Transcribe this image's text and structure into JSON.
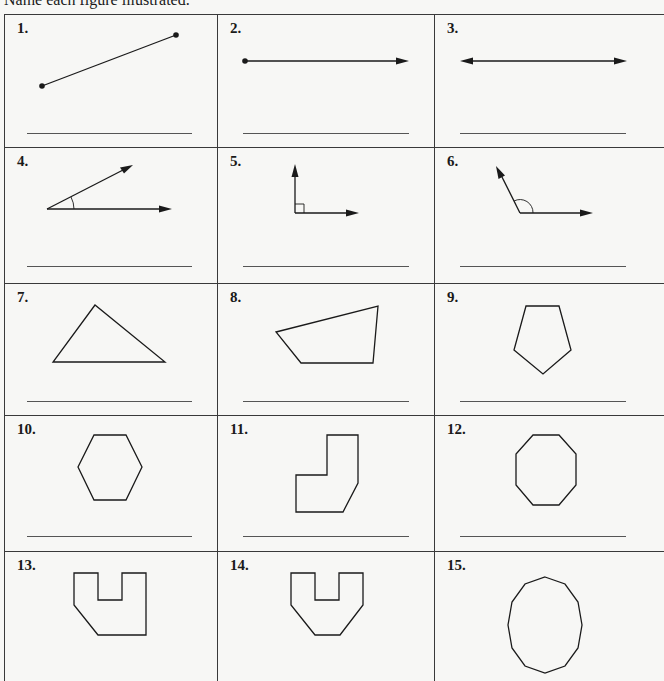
{
  "worksheet": {
    "instructions": "Name each figure illustrated.",
    "items": [
      {
        "number": "1.",
        "figure": "line-segment",
        "answer": ""
      },
      {
        "number": "2.",
        "figure": "ray",
        "answer": ""
      },
      {
        "number": "3.",
        "figure": "line",
        "answer": ""
      },
      {
        "number": "4.",
        "figure": "acute-angle",
        "answer": ""
      },
      {
        "number": "5.",
        "figure": "right-angle",
        "answer": ""
      },
      {
        "number": "6.",
        "figure": "obtuse-angle",
        "answer": ""
      },
      {
        "number": "7.",
        "figure": "triangle",
        "answer": ""
      },
      {
        "number": "8.",
        "figure": "quadrilateral",
        "answer": ""
      },
      {
        "number": "9.",
        "figure": "pentagon",
        "answer": ""
      },
      {
        "number": "10.",
        "figure": "hexagon",
        "answer": ""
      },
      {
        "number": "11.",
        "figure": "hexagon-irregular",
        "answer": ""
      },
      {
        "number": "12.",
        "figure": "octagon",
        "answer": ""
      },
      {
        "number": "13.",
        "figure": "heptagon-irregular",
        "answer": ""
      },
      {
        "number": "14.",
        "figure": "octagon-irregular",
        "answer": ""
      },
      {
        "number": "15.",
        "figure": "decagon",
        "answer": ""
      }
    ]
  }
}
